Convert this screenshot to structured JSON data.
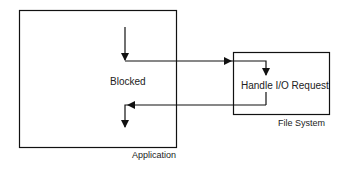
{
  "diagram": {
    "application": {
      "label": "Application",
      "state_label": "Blocked"
    },
    "file_system": {
      "label": "File System",
      "task_label": "Handle I/O Request"
    },
    "colors": {
      "stroke": "#111111",
      "text": "#222222",
      "background": "#ffffff"
    }
  }
}
